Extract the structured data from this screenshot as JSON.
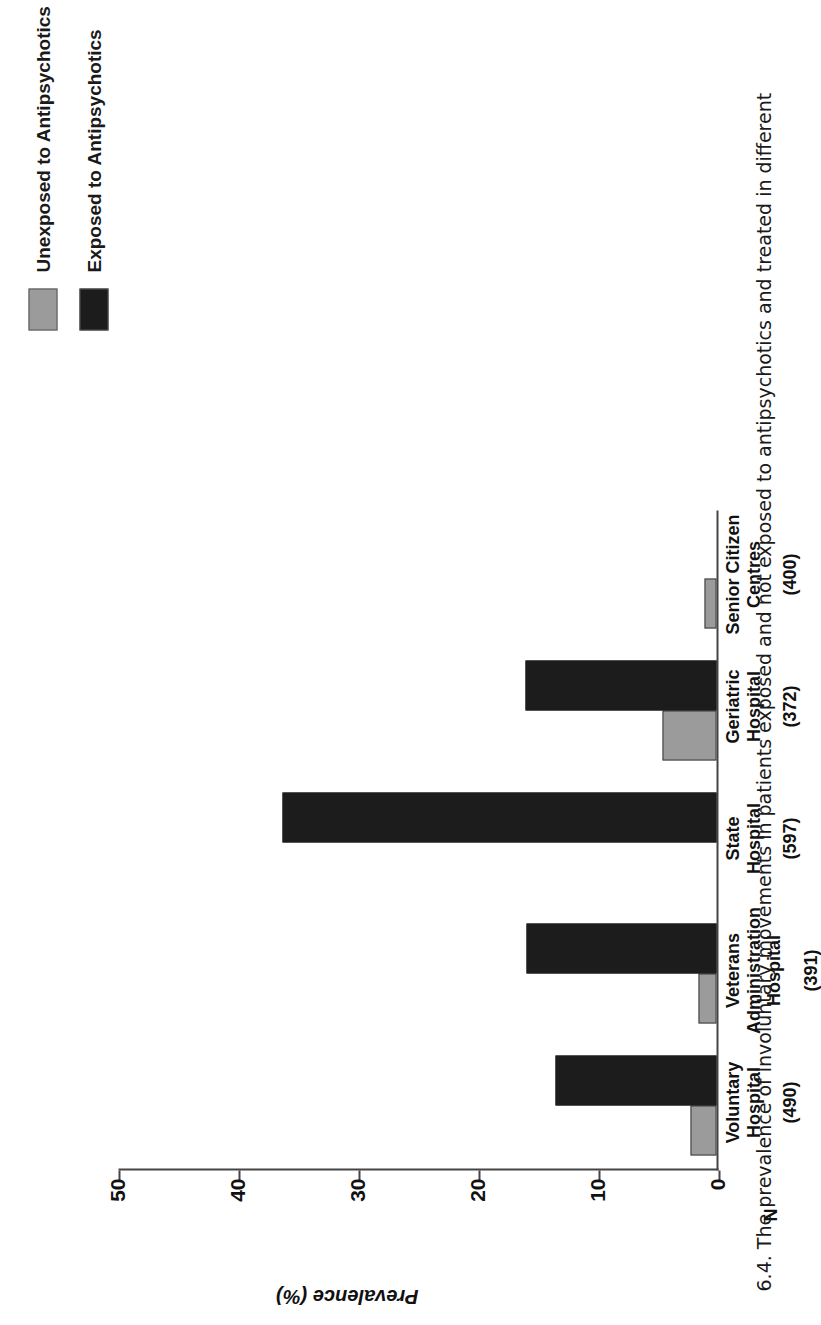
{
  "legend": {
    "items": [
      {
        "label": "Unexposed to Antipsychotics",
        "color": "#9b9b9b",
        "key": "unexposed"
      },
      {
        "label": "Exposed to Antipsychotics",
        "color": "#1c1c1c",
        "key": "exposed"
      }
    ]
  },
  "axis": {
    "y_title": "Prevalence (%)",
    "ticks": [
      "0",
      "10",
      "20",
      "30",
      "40",
      "50"
    ],
    "n_marker": "N"
  },
  "categories": [
    {
      "name": "Voluntary Hospital",
      "line1": "Voluntary",
      "line2": "Hospital",
      "line3": "",
      "n": "(490)"
    },
    {
      "name": "Veterans Administration Hospital",
      "line1": "Veterans",
      "line2": "Administration",
      "line3": "Hospital",
      "n": "(391)"
    },
    {
      "name": "State Hospital",
      "line1": "State",
      "line2": "Hospital",
      "line3": "",
      "n": "(597)"
    },
    {
      "name": "Geriatric Hospital",
      "line1": "Geriatric",
      "line2": "Hospital",
      "line3": "",
      "n": "(372)"
    },
    {
      "name": "Senior Citizen Centres",
      "line1": "Senior Citizen",
      "line2": "Centres",
      "line3": "",
      "n": "(400)"
    }
  ],
  "caption": "6.4.  The prevalence of involuntary movements in patients exposed and not exposed to antipsychotics and treated in different",
  "chart_data": {
    "type": "bar",
    "title": "",
    "xlabel": "",
    "ylabel": "Prevalence (%)",
    "ylim": [
      0,
      50
    ],
    "yticks": [
      0,
      10,
      20,
      30,
      40,
      50
    ],
    "grid": false,
    "legend_position": "top-right",
    "categories": [
      "Voluntary Hospital",
      "Veterans Administration Hospital",
      "State Hospital",
      "Geriatric Hospital",
      "Senior Citizen Centres"
    ],
    "group_n": [
      490,
      391,
      597,
      372,
      400
    ],
    "series": [
      {
        "name": "Unexposed to Antipsychotics",
        "color": "#9b9b9b",
        "values": [
          2.2,
          1.5,
          0,
          4.5,
          1.0
        ]
      },
      {
        "name": "Exposed to Antipsychotics",
        "color": "#1c1c1c",
        "values": [
          13.4,
          15.8,
          36.2,
          15.9,
          0
        ]
      }
    ]
  }
}
